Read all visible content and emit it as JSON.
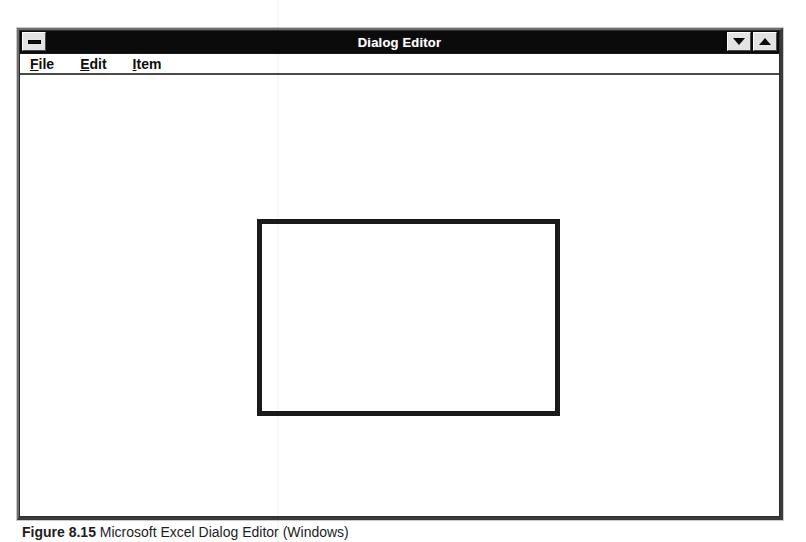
{
  "window": {
    "title": "Dialog Editor",
    "system_menu_icon": "minimize-bar-icon",
    "buttons": [
      {
        "name": "minimize-button",
        "icon": "triangle-down-icon"
      },
      {
        "name": "maximize-button",
        "icon": "triangle-up-icon"
      }
    ]
  },
  "menubar": {
    "items": [
      {
        "accel": "F",
        "rest": "ile",
        "label": "File"
      },
      {
        "accel": "E",
        "rest": "dit",
        "label": "Edit"
      },
      {
        "accel": "I",
        "rest": "tem",
        "label": "Item"
      }
    ]
  },
  "canvas": {
    "dialog_rect": {
      "name": "dialog-frame",
      "border_color": "#1a1a1a",
      "fill_color": "#ffffff"
    }
  },
  "caption": {
    "label": "Figure 8.15",
    "text": "Microsoft Excel Dialog Editor (Windows)"
  },
  "colors": {
    "titlebar_bg": "#0b0b0b",
    "titlebar_text": "#ffffff",
    "window_bg": "#ffffff",
    "button_face": "#e3e3e3",
    "border_dark": "#2b2b2b",
    "page_bg": "#ffffff"
  }
}
